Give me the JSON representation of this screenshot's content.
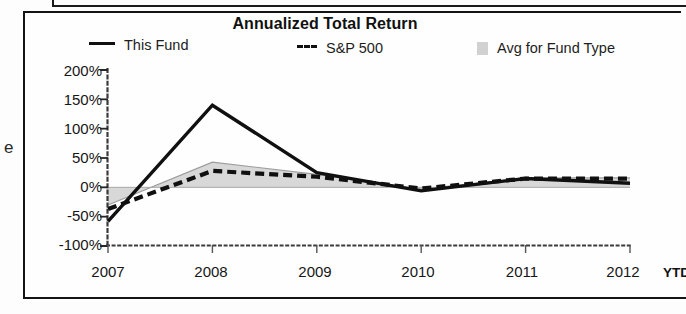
{
  "chart_panel": {
    "title": "Annualized Total Return",
    "legend": [
      {
        "label": "This Fund",
        "marker": "solid-line-swatch"
      },
      {
        "label": "S&P 500",
        "marker": "dashed-line-swatch"
      },
      {
        "label": "Avg for Fund Type",
        "marker": "gray-area-swatch"
      }
    ],
    "ytd_note": "YTD",
    "stray_glyph": "e"
  },
  "chart_data": {
    "type": "line",
    "title": "Annualized Total Return",
    "xlabel": "",
    "ylabel": "",
    "x": [
      "2007",
      "2008",
      "2009",
      "2010",
      "2011",
      "2012"
    ],
    "xtick_labels": [
      "2007",
      "2008",
      "2009",
      "2010",
      "2011",
      "2012"
    ],
    "ytick_labels": [
      "200%",
      "150%",
      "100%",
      "50%",
      "0%",
      "-50%",
      "-100%"
    ],
    "yticks": [
      200,
      150,
      100,
      50,
      0,
      -50,
      -100
    ],
    "ylim": [
      -100,
      200
    ],
    "grid": false,
    "legend_position": "top",
    "series": [
      {
        "name": "This Fund",
        "style": "solid",
        "color": "#101010",
        "values": [
          -58,
          140,
          25,
          -6,
          15,
          7
        ]
      },
      {
        "name": "S&P 500",
        "style": "dashed",
        "color": "#101010",
        "values": [
          -37,
          28,
          18,
          -2,
          15,
          15
        ]
      },
      {
        "name": "Avg for Fund Type",
        "style": "area",
        "color": "#c9c9c9",
        "values": [
          -30,
          43,
          22,
          -3,
          16,
          16
        ]
      }
    ]
  }
}
